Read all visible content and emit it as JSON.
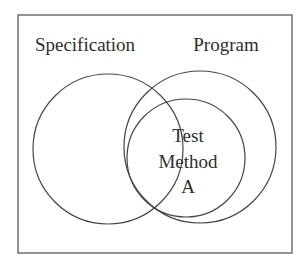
{
  "diagram": {
    "type": "venn",
    "frame": {
      "x": 18,
      "y": 15,
      "width": 274,
      "height": 238,
      "stroke": "#5a5a5a"
    },
    "sets": [
      {
        "id": "specification",
        "label": "Specification",
        "label_pos": {
          "x": 85,
          "y": 51
        },
        "circle": {
          "cx": 108,
          "cy": 149,
          "r": 75
        },
        "stroke": "#454545"
      },
      {
        "id": "program",
        "label": "Program",
        "label_pos": {
          "x": 226,
          "y": 51
        },
        "circle": {
          "cx": 200,
          "cy": 147,
          "r": 76
        },
        "stroke": "#454545"
      },
      {
        "id": "test-method-a",
        "label_lines": [
          "Test",
          "Method",
          "A"
        ],
        "label_pos": {
          "x": 188,
          "y": 142,
          "line_height": 25.5
        },
        "circle": {
          "cx": 186,
          "cy": 158,
          "r": 59
        },
        "stroke": "#454545"
      }
    ],
    "text_color": "#2e2e2e"
  }
}
